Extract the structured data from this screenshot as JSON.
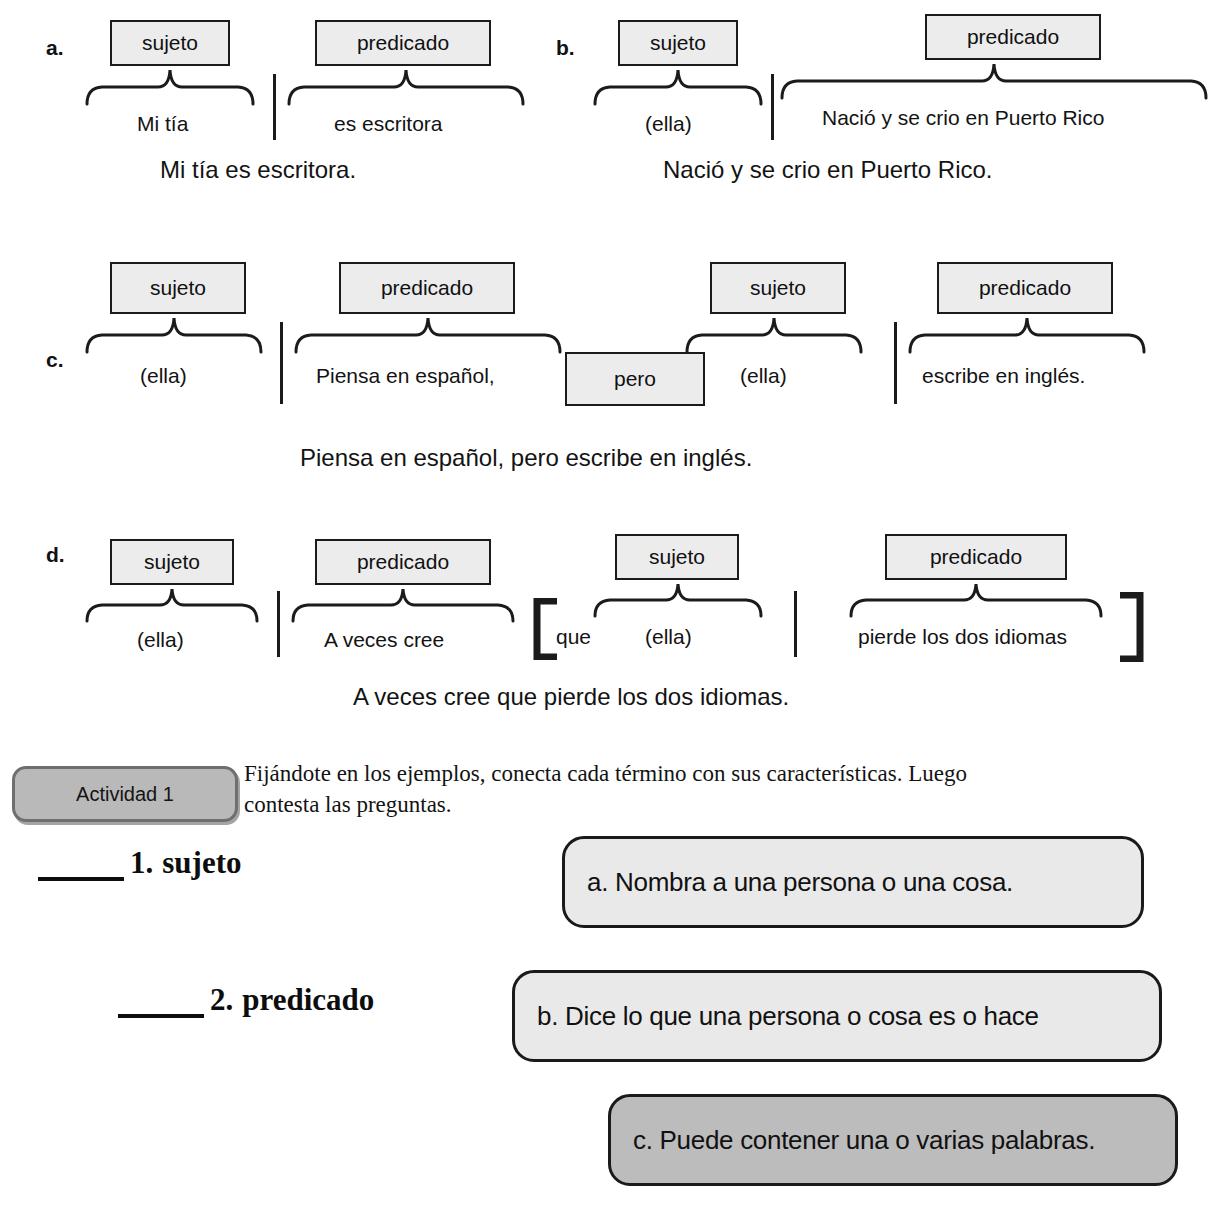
{
  "labels": {
    "sujeto": "sujeto",
    "predicado": "predicado",
    "pero": "pero",
    "que": "que"
  },
  "examples": [
    {
      "letter": "a.",
      "subject_box": "sujeto",
      "predicate_box": "predicado",
      "subject_phrase": "Mi tía",
      "predicate_phrase": "es escritora",
      "full_sentence": "Mi tía es escritora."
    },
    {
      "letter": "b.",
      "subject_box": "sujeto",
      "predicate_box": "predicado",
      "subject_phrase": "(ella)",
      "predicate_phrase": "Nació y se crio en Puerto Rico",
      "full_sentence": "Nació y se crio en Puerto Rico."
    },
    {
      "letter": "c.",
      "subject_box_1": "sujeto",
      "predicate_box_1": "predicado",
      "connector_box": "pero",
      "subject_box_2": "sujeto",
      "predicate_box_2": "predicado",
      "subject_phrase_1": "(ella)",
      "predicate_phrase_1": "Piensa en español,",
      "subject_phrase_2": "(ella)",
      "predicate_phrase_2": "escribe en inglés.",
      "full_sentence": "Piensa en español, pero escribe en inglés."
    },
    {
      "letter": "d.",
      "subject_box_1": "sujeto",
      "predicate_box_1": "predicado",
      "subject_box_2": "sujeto",
      "predicate_box_2": "predicado",
      "subject_phrase_1": "(ella)",
      "predicate_phrase_1": "A veces cree",
      "conjunction": "que",
      "subject_phrase_2": "(ella)",
      "predicate_phrase_2": "pierde los dos idiomas",
      "full_sentence": "A veces cree que pierde los dos idiomas."
    }
  ],
  "activity": {
    "badge_label": "Actividad 1",
    "instructions_line_1": "Fijándote en los ejemplos, conecta cada término con sus características. Luego",
    "instructions_line_2": "contesta las preguntas.",
    "match_items": [
      {
        "number": "1.",
        "term": "sujeto"
      },
      {
        "number": "2.",
        "term": "predicado"
      }
    ],
    "options": [
      {
        "letter": "a.",
        "text": "a. Nombra a una persona o una cosa.",
        "shade": "light"
      },
      {
        "letter": "b.",
        "text": "b. Dice lo que una persona o cosa es o hace",
        "shade": "light"
      },
      {
        "letter": "c.",
        "text": "c. Puede contener una o varias palabras.",
        "shade": "dark"
      }
    ]
  },
  "colors": {
    "box_fill": "#ececed",
    "box_border": "#1b1b1b",
    "badge_fill": "#b9b9b9",
    "badge_border": "#6f6f6f",
    "option_light": "#e9e9e9",
    "option_dark": "#bcbcbc",
    "text": "#121212"
  }
}
